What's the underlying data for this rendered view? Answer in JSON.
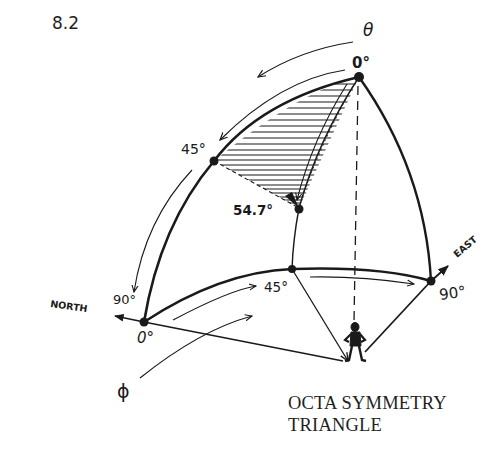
{
  "figure": {
    "number": "8.2",
    "caption_line1": "OCTA SYMMETRY",
    "caption_line2": "TRIANGLE"
  },
  "labels": {
    "theta_symbol": "θ",
    "phi_symbol": "ϕ",
    "zenith_theta": "0°",
    "theta_45": "45°",
    "theta_90": "90°",
    "vertex_54_7": "54.7°",
    "phi_0": "0°",
    "phi_45": "45°",
    "phi_90": "90°",
    "north": "NORTH",
    "east": "EAST"
  },
  "points": {
    "zenith": [
      359,
      77
    ],
    "theta45": [
      214,
      161
    ],
    "magic_angle": [
      299,
      208
    ],
    "north_horizon": [
      144,
      322
    ],
    "horizon45": [
      292,
      269
    ],
    "east_horizon": [
      431,
      281
    ],
    "observer": [
      349,
      362
    ]
  },
  "colors": {
    "ink": "#1a1a1a",
    "background": "#ffffff"
  }
}
